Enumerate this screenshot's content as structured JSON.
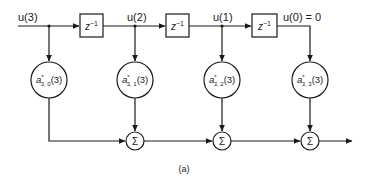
{
  "diagram": {
    "caption": "(a)",
    "signals": [
      {
        "label": "u(3)"
      },
      {
        "label": "u(2)"
      },
      {
        "label": "u(1)"
      },
      {
        "label": "u(0) = 0"
      }
    ],
    "delays": [
      {
        "base": "z",
        "exp": "−1"
      },
      {
        "base": "z",
        "exp": "−1"
      },
      {
        "base": "z",
        "exp": "−1"
      }
    ],
    "coefficients": [
      {
        "base": "a",
        "sup": "*",
        "sub": "3, 0",
        "arg": "(3)"
      },
      {
        "base": "a",
        "sup": "*",
        "sub": "3, 1",
        "arg": "(3)"
      },
      {
        "base": "a",
        "sup": "*",
        "sub": "3, 2",
        "arg": "(3)"
      },
      {
        "base": "a",
        "sup": "*",
        "sub": "3, 3",
        "arg": "(3)"
      }
    ],
    "summers": [
      {
        "symbol": "Σ"
      },
      {
        "symbol": "Σ"
      },
      {
        "symbol": "Σ"
      }
    ]
  }
}
